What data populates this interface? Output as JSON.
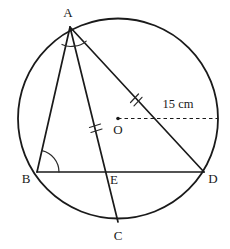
{
  "figure": {
    "width": 230,
    "height": 249,
    "background": "#ffffff",
    "ink_color": "#1a1a1a"
  },
  "circle": {
    "center": {
      "x": 118,
      "y": 118.5
    },
    "radius": 100,
    "center_label": "O",
    "center_label_position": {
      "x": 118,
      "y": 131
    }
  },
  "points": [
    {
      "id": "A",
      "label": "A",
      "x": 70,
      "y": 27,
      "label_x": 68,
      "label_y": 14,
      "on_circle": true
    },
    {
      "id": "B",
      "label": "B",
      "x": 37,
      "y": 172,
      "label_x": 26,
      "label_y": 180,
      "on_circle": true
    },
    {
      "id": "C",
      "label": "C",
      "x": 118,
      "y": 222,
      "label_x": 118,
      "label_y": 237,
      "on_circle": true
    },
    {
      "id": "D",
      "label": "D",
      "x": 204,
      "y": 172,
      "label_x": 213,
      "label_y": 180,
      "on_circle": true
    },
    {
      "id": "E",
      "label": "E",
      "x": 105,
      "y": 172,
      "label_x": 114,
      "label_y": 181,
      "on_circle": false
    },
    {
      "id": "O",
      "label": "O",
      "x": 118,
      "y": 118.5,
      "label_x": 118,
      "label_y": 131,
      "on_circle": false
    }
  ],
  "chords": [
    {
      "id": "AB",
      "from": "A",
      "to": "B"
    },
    {
      "id": "AC",
      "from": "A",
      "to": "C"
    },
    {
      "id": "AD",
      "from": "A",
      "to": "D"
    },
    {
      "id": "BD",
      "from": "B",
      "to": "D"
    }
  ],
  "radius_line": {
    "label": "15 cm",
    "style": "dashed",
    "from": {
      "x": 118,
      "y": 118.5
    },
    "to": {
      "x": 218,
      "y": 118.5
    },
    "label_x": 178,
    "label_y": 105
  },
  "tick_marks": [
    {
      "id": "tick-ad",
      "on_segment": "AD",
      "count": 2,
      "x": 135,
      "y": 100
    },
    {
      "id": "tick-ac",
      "on_segment": "AC",
      "count": 2,
      "x": 95,
      "y": 127
    }
  ],
  "angle_marks": [
    {
      "id": "angle-a",
      "at_vertex": "A",
      "arcs": 2,
      "note": "equal angles BAC and CAD"
    },
    {
      "id": "angle-b",
      "at_vertex": "B",
      "arcs": 1,
      "note": "angle ABD"
    }
  ]
}
